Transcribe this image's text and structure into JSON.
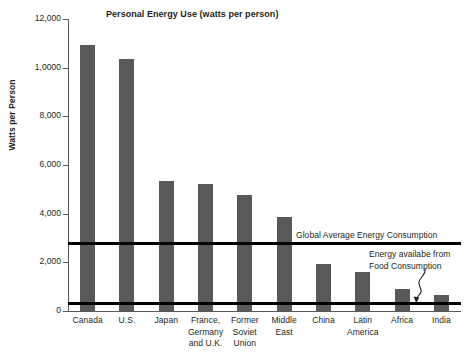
{
  "chart_data": {
    "type": "bar",
    "title": "Personal Energy Use (watts per person)",
    "xlabel": "",
    "ylabel": "Watts per Person",
    "ylim": [
      0,
      12000
    ],
    "grid": false,
    "legend": null,
    "categories": [
      "Canada",
      "U.S.",
      "Japan",
      "France, Germany and U.K.",
      "Former Soviet Union",
      "Middle East",
      "China",
      "Latin America",
      "Africa",
      "India"
    ],
    "values": [
      10950,
      10350,
      5350,
      5200,
      4750,
      3850,
      1950,
      1600,
      900,
      650
    ],
    "ytick_values": [
      0,
      2000,
      4000,
      6000,
      8000,
      10000,
      12000
    ],
    "ytick_labels": [
      "0",
      "2,000",
      "4,000",
      "6,000",
      "8,000",
      "1,0000",
      "12,000"
    ],
    "annotations": [
      {
        "name": "global-average-line",
        "label": "Global Average Energy Consumption",
        "value": 2800
      },
      {
        "name": "food-consumption-line",
        "label_line1": "Energy availabe from",
        "label_line2": "Food Consumption",
        "value": 330
      }
    ],
    "colors": {
      "bar": "#58595b",
      "reference_line": "#000000",
      "axis": "#58595b",
      "text": "#231f20",
      "background": "#ffffff"
    }
  },
  "xlabels_wrapped": [
    [
      "Canada"
    ],
    [
      "U.S."
    ],
    [
      "Japan"
    ],
    [
      "France,",
      "Germany",
      "and U.K."
    ],
    [
      "Former",
      "Soviet",
      "Union"
    ],
    [
      "Middle",
      "East"
    ],
    [
      "China"
    ],
    [
      "Latin",
      "America"
    ],
    [
      "Africa"
    ],
    [
      "India"
    ]
  ]
}
